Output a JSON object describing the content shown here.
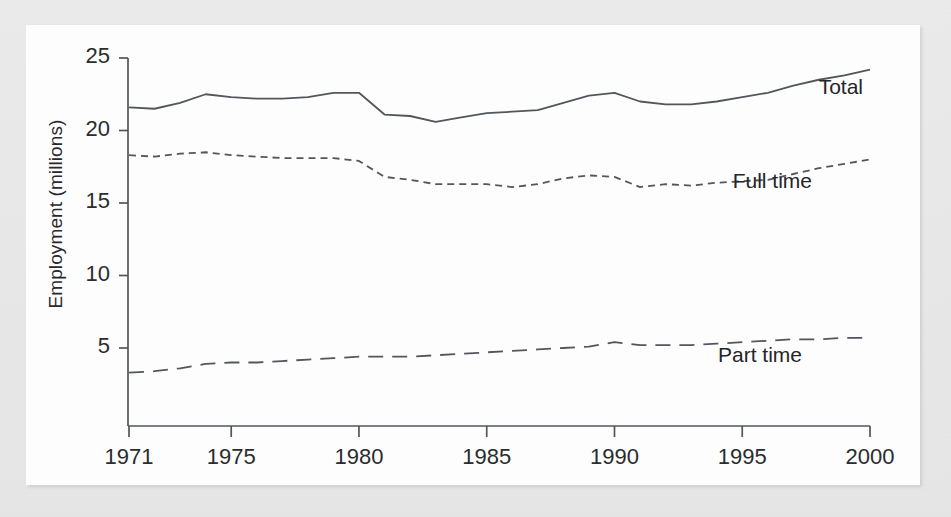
{
  "figure": {
    "background_color": "#e8e8e8",
    "paper_color": "#fdfdfd",
    "ink_color": "#53565a",
    "text_color": "#2a2c2e"
  },
  "chart_data": {
    "type": "line",
    "title": "",
    "subtitle": "",
    "xlabel": "",
    "ylabel": "Employment (millions)",
    "xlim": [
      1971,
      2000
    ],
    "ylim": [
      0,
      25
    ],
    "grid": false,
    "legend_position": "inline-right",
    "yticks": [
      5,
      10,
      15,
      20,
      25
    ],
    "ytick_labels": [
      "5",
      "10",
      "15",
      "20",
      "25"
    ],
    "xticks": [
      1971,
      1975,
      1980,
      1985,
      1990,
      1995,
      2000
    ],
    "xtick_labels": [
      "1971",
      "1975",
      "1980",
      "1985",
      "1990",
      "1995",
      "2000"
    ],
    "x": [
      1971,
      1972,
      1973,
      1974,
      1975,
      1976,
      1977,
      1978,
      1979,
      1980,
      1981,
      1982,
      1983,
      1984,
      1985,
      1986,
      1987,
      1988,
      1989,
      1990,
      1991,
      1992,
      1993,
      1994,
      1995,
      1996,
      1997,
      1998,
      1999,
      2000
    ],
    "series": [
      {
        "name": "Total",
        "style": "solid",
        "color": "#53565a",
        "label": "Total",
        "values": [
          21.6,
          21.5,
          21.9,
          22.5,
          22.3,
          22.2,
          22.2,
          22.3,
          22.6,
          22.6,
          21.1,
          21.0,
          20.6,
          20.9,
          21.2,
          21.3,
          21.4,
          21.9,
          22.4,
          22.6,
          22.0,
          21.8,
          21.8,
          22.0,
          22.3,
          22.6,
          23.1,
          23.5,
          23.8,
          24.2
        ]
      },
      {
        "name": "Full time",
        "style": "dashed-short",
        "color": "#53565a",
        "label": "Full time",
        "values": [
          18.3,
          18.2,
          18.4,
          18.5,
          18.3,
          18.2,
          18.1,
          18.1,
          18.1,
          17.9,
          16.8,
          16.6,
          16.3,
          16.3,
          16.3,
          16.1,
          16.3,
          16.7,
          16.9,
          16.8,
          16.1,
          16.3,
          16.2,
          16.4,
          16.5,
          16.6,
          17.0,
          17.4,
          17.7,
          18.0
        ]
      },
      {
        "name": "Part time",
        "style": "dashed-long",
        "color": "#53565a",
        "label": "Part time",
        "values": [
          3.3,
          3.4,
          3.6,
          3.9,
          4.0,
          4.0,
          4.1,
          4.2,
          4.3,
          4.4,
          4.4,
          4.4,
          4.5,
          4.6,
          4.7,
          4.8,
          4.9,
          5.0,
          5.1,
          5.4,
          5.2,
          5.2,
          5.2,
          5.3,
          5.4,
          5.5,
          5.6,
          5.6,
          5.7,
          5.7
        ]
      }
    ],
    "series_label_positions": [
      {
        "name": "Total",
        "x": 837,
        "y": 50
      },
      {
        "name": "Full time",
        "x": 786,
        "y": 144
      },
      {
        "name": "Part time",
        "x": 776,
        "y": 318
      }
    ]
  }
}
